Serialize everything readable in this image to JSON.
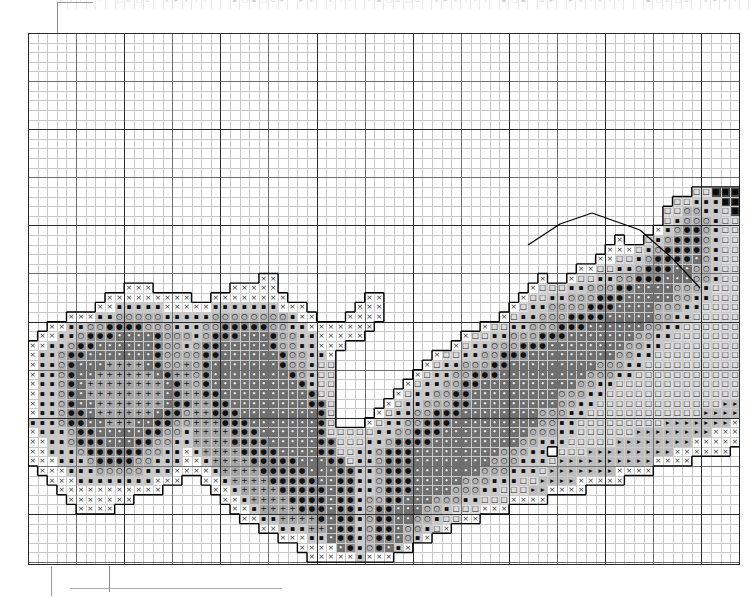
{
  "document": {
    "type": "cross-stitch-pattern-chart",
    "title": "Cross Stitch Pattern Chart",
    "monochrome": true
  },
  "grid": {
    "cell_px": 9.62,
    "columns": 74,
    "rows": 55,
    "minor_line_color": "#c9c9c9",
    "mid_line_every": 5,
    "mid_line_color": "#6e6e6e",
    "major_line_every": 10,
    "major_line_color": "#2b2b2b",
    "border_color": "#2b2b2b",
    "background": "#ffffff",
    "left_px": 28,
    "top_px": 33,
    "width_px": 712,
    "height_px": 532
  },
  "markers": {
    "center_arrow_left": "▶",
    "center_tick_top": true,
    "center_tick_bottom": true,
    "arrow_color": "#1a1a1a"
  },
  "page_marks": {
    "corner_rule_color": "#9a9a9a",
    "bottom_rule_color": "#b0b0b0"
  },
  "cutoff_row": {
    "visible": true,
    "opacity": 0.3,
    "symbols": "x o ▪ + ▸ □ •"
  },
  "symbols": {
    "legend": [
      {
        "glyph": "×",
        "name": "cross-x",
        "fill": "#ffffff",
        "ink": "#333333"
      },
      {
        "glyph": "▪",
        "name": "small-square",
        "fill": "#c9c9c9",
        "ink": "#111111"
      },
      {
        "glyph": "○",
        "name": "open-circle",
        "fill": "#b4b4b4",
        "ink": "#111111"
      },
      {
        "glyph": "●",
        "name": "filled-circle",
        "fill": "#8f8f8f",
        "ink": "#111111"
      },
      {
        "glyph": "+",
        "name": "plus",
        "fill": "#a5a5a5",
        "ink": "#111111"
      },
      {
        "glyph": "▸",
        "name": "right-triangle",
        "fill": "#bdbdbd",
        "ink": "#111111"
      },
      {
        "glyph": "□",
        "name": "open-square",
        "fill": "#dcdcdc",
        "ink": "#222222"
      },
      {
        "glyph": "•",
        "name": "dot",
        "fill": "#6f6f6f",
        "ink": "#f2f2f2"
      },
      {
        "glyph": "■",
        "name": "black-square",
        "fill": "#4a4a4a",
        "ink": "#0a0a0a"
      },
      {
        "glyph": "▫",
        "name": "tiny-square",
        "fill": "#e8e8e8",
        "ink": "#333333"
      }
    ]
  },
  "chart_data": {
    "type": "heatmap",
    "xlabel": "",
    "ylabel": "",
    "grid": true,
    "legend": "none",
    "cols": 74,
    "rows": 55,
    "palette_keys": [
      ".",
      "x",
      "s",
      "o",
      "O",
      "p",
      "t",
      "q",
      "d",
      "B",
      "u"
    ],
    "palette_desc": {
      ".": "empty / unstitched",
      "x": "cross-x on white",
      "s": "small-square on light gray",
      "o": "open-circle on mid gray",
      "O": "filled-circle on gray",
      "p": "plus on gray",
      "t": "right-triangle on light gray",
      "q": "open-square on pale gray",
      "d": "dot on dark gray",
      "B": "black-square on dark",
      "u": "tiny-square on near-white"
    },
    "rows_data": [
      "..........................................................................",
      "..........................................................................",
      "..........................................................................",
      "..........................................................................",
      "..........................................................................",
      "..........................................................................",
      "..........................................................................",
      "..........................................................................",
      "..........................................................................",
      "..........................................................................",
      "..........................................................................",
      "..........................................................................",
      "..........................................................................",
      "..........................................................................",
      "..........................................................................",
      "..........................................................................",
      ".....................................................................qqBBB",
      "...................................................................qqsssBB",
      "..................................................................qqoossqB",
      "..................................................................qsooosqqB",
      ".................................................................xsoOOosqqq",
      ".............................................................x..qsoOOOosqqq",
      "............................................................xxxqsoOOOOosqqq",
      "...........................................................xxqqsoOOOOdosqqq",
      ".........................................................xxqqssoOOOddoosqqq",
      "........................xx...........................x..xqqssooOOOdddoosqqq",
      "..........xxx........xxxxx..........................xqqqssoooOOddddooosqqqq",
      "........xxxxxxxxx..xxxxxxxx........xx..............xqqssoooOOOdddddoossqqqq",
      ".......xxsssssxxxxxsssssssxxx.....xxx.............xqssooooOOOddddooossqqqqq",
      "....xxxssooooosssssoooooooosxx...xxxx............xqssoooOOOOdddddoossqqqqqq",
      "..xxssooOOOOooosssooOOOOOoossxxxxxxx...........xqqssoooOOOddddddoossqqqqqqq",
      ".xxssoOOOddddOooosoOOOdddOoossxxxxx..........xqqssoooOOOdddddddoossqqqqqqqq",
      "xxssoOOddddddOoosoOOdddddOoossxxx...........xqssoooOOOddddddddoossqqqqqqqqq",
      "xssoOOdddddddOooooOOddddddOoossx..........xqqssooOOOdddddddddoossqqqqqqqqqq",
      "xssoOdddppppdOoopoOdddddddOoosqq.........xqssoooOOdddddddddooossqqqqqqqqqqq",
      "xssoOddppppppdOppoOddddddddOosqq........xqssooOOOdddddddddooossqqqqqqqqqqqq",
      "xssoOdppppppppdOpoOdddddddddOsqq.......xqssooOOddddddddddoossqqqqqqqqqqqqqq",
      "xssoOdppppppppdOppOOdddddddddOqq......xqssooOOdddddddddooossqqqqqqqqqqqqqqq",
      "xssoOddpppppppdOOppOOddddddddOOq.....xqssoooOOdddddddddoossqqqqqqqqqqqqqttt",
      "xssoOOdppppppdOOoppOOOddddddddOq....xqssooOOOddddddddooossqqqqqqqqqqqqttttt",
      "sssoOOddpppddOOoopppOOOdddddddOq...xqssooOOOdddddddddoossqqqqqqqqqtttttttxx",
      "xsssoOOdddddOOoosppppOOOddddddOqqqqqssooOOOdddddddddooossqqqqqqttttttttxxxx",
      "xxssoOOOdddOOoossppppOOOOdddddOOqqqssoOOOOdddddddddoosssqqqqqttttttttxxxxxx",
      "xxsssoOOOOOOoossxsppppOOOOddddOOqqssoOOOdddddddddoooss qqqtttttttttxxxxxx..",
      "xxxsssoOOOOoosssxxsppppOOOOOdddOOqssoOOOddddddddooosssqttttttttttxxxx......",
      ".xxxsssooooosssxxxxsppppOOOOOdddOOssoOOOdddddddooosssqtttttttxxxx..........",
      "..xxxssssssssxxx..xxsppppOOOOOddOOssoOOOdddddooosssqqttttxxxxx............",
      "...xxxxxxxxxxx.....xxsppppOOOOOdOOssoOOOddddooossqqqttxxxx................",
      "....xxxxxxx.........xxsppppOOOOdOOsooOOdddooossqqqxxxx....................",
      ".....xxxx............xxsppppOOOdOOsoOOdddoosqqqxxx........................",
      "......................xxssppppOdOOsoOOddoosqqxx...........................",
      "........................xxsssppdOOsoOOdoosqx.............................",
      "..........................xxxssdOOsoOOdosx................................",
      "............................xxxxdOsoOdsx..................................",
      ".............................xxxxxsxxx...................................."
    ]
  },
  "backstitch": {
    "color": "#000000",
    "segments": [
      {
        "x1": 528,
        "y1": 245,
        "x2": 560,
        "y2": 224
      },
      {
        "x1": 560,
        "y1": 224,
        "x2": 592,
        "y2": 213
      },
      {
        "x1": 592,
        "y1": 213,
        "x2": 640,
        "y2": 230
      },
      {
        "x1": 640,
        "y1": 230,
        "x2": 672,
        "y2": 258
      },
      {
        "x1": 672,
        "y1": 258,
        "x2": 700,
        "y2": 288
      }
    ]
  }
}
